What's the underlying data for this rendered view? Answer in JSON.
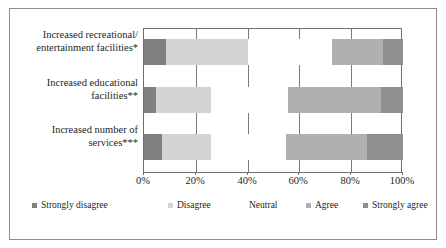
{
  "chart_data": {
    "type": "bar",
    "orientation": "horizontal",
    "stacked": true,
    "title": "",
    "subtitle": "",
    "xlabel": "",
    "ylabel": "",
    "xlim": [
      0,
      100
    ],
    "grid": true,
    "legend_position": "bottom",
    "categories": [
      "Increased recreational/ entertainment facilities*",
      "Increased educational facilities**",
      "Increased number of services***"
    ],
    "category_lines": [
      [
        "Increased recreational/",
        "entertainment facilities*"
      ],
      [
        "Increased educational",
        "facilities**"
      ],
      [
        "Increased number of",
        "services***"
      ]
    ],
    "tick_labels": [
      "0%",
      "20%",
      "40%",
      "60%",
      "80%",
      "100%"
    ],
    "tick_values": [
      0,
      20,
      40,
      60,
      80,
      100
    ],
    "series": [
      {
        "name": "Strongly disagree",
        "color": "#808080",
        "values": [
          8.5,
          4.6,
          7.0
        ]
      },
      {
        "name": "Disagree",
        "color": "#d4d4d4",
        "values": [
          31.5,
          21.3,
          19.0
        ]
      },
      {
        "name": "Neutral",
        "color": "#ffffff",
        "values": [
          32.6,
          29.7,
          29.0
        ]
      },
      {
        "name": "Agree",
        "color": "#b0b0b0",
        "values": [
          19.7,
          35.9,
          31.0
        ]
      },
      {
        "name": "Strongly agree",
        "color": "#8f8f8f",
        "values": [
          7.7,
          8.5,
          14.0
        ]
      }
    ],
    "legend": [
      {
        "label": "Strongly disagree",
        "color": "#808080"
      },
      {
        "label": "Disagree",
        "color": "#d4d4d4"
      },
      {
        "label": "Neutral",
        "color": "#ffffff"
      },
      {
        "label": "Agree",
        "color": "#b0b0b0"
      },
      {
        "label": "Strongly agree",
        "color": "#8f8f8f"
      }
    ]
  }
}
